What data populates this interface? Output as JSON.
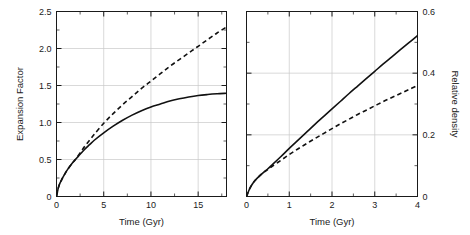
{
  "figure": {
    "width": 470,
    "height": 235,
    "background": "#ffffff",
    "ink_color": "#111111",
    "grid_color": "#c8c8c8"
  },
  "chart_data": [
    {
      "type": "line",
      "panel": "left",
      "title": "",
      "xlabel": "Time (Gyr)",
      "ylabel": "Expansion Factor",
      "xlim": [
        0,
        18
      ],
      "ylim": [
        0,
        2.5
      ],
      "xticks": [
        0,
        5,
        10,
        15
      ],
      "xticklabels": [
        "0",
        "5",
        "10",
        "15"
      ],
      "xminorticks": [
        2.5,
        7.5,
        12.5,
        17.5
      ],
      "yticks": [
        0,
        0.5,
        1.0,
        1.5,
        2.0,
        2.5
      ],
      "yticklabels": [
        "0",
        "0.5",
        "1.0",
        "1.5",
        "2.0",
        "2.5"
      ],
      "yminorticks": [
        0.25,
        0.75,
        1.25,
        1.75,
        2.25
      ],
      "grid": true,
      "yaxis_side": "left",
      "series": [
        {
          "name": "solid-curve",
          "style": "solid",
          "x": [
            0,
            0.2,
            0.4,
            0.6,
            0.9,
            1.2,
            1.6,
            2.0,
            2.5,
            3.0,
            3.5,
            4.0,
            5.0,
            6.0,
            7.0,
            8.0,
            9.0,
            10.0,
            11.0,
            12.0,
            13.0,
            14.0,
            15.0,
            16.0,
            17.0,
            18.0
          ],
          "y": [
            0,
            0.12,
            0.19,
            0.24,
            0.31,
            0.37,
            0.44,
            0.5,
            0.57,
            0.64,
            0.7,
            0.76,
            0.86,
            0.95,
            1.03,
            1.1,
            1.16,
            1.21,
            1.25,
            1.29,
            1.32,
            1.345,
            1.365,
            1.378,
            1.388,
            1.395
          ]
        },
        {
          "name": "dashed-curve",
          "style": "dashed",
          "x": [
            0,
            0.2,
            0.4,
            0.6,
            0.9,
            1.2,
            1.6,
            2.0,
            2.5,
            3.0,
            3.5,
            4.0,
            5.0,
            6.0,
            7.0,
            8.0,
            9.0,
            10.0,
            11.0,
            12.0,
            13.0,
            14.0,
            15.0,
            16.0,
            17.0,
            18.0
          ],
          "y": [
            0,
            0.12,
            0.19,
            0.24,
            0.31,
            0.37,
            0.44,
            0.5,
            0.59,
            0.68,
            0.76,
            0.84,
            0.99,
            1.12,
            1.24,
            1.35,
            1.46,
            1.56,
            1.66,
            1.76,
            1.85,
            1.94,
            2.03,
            2.12,
            2.21,
            2.29
          ]
        }
      ]
    },
    {
      "type": "line",
      "panel": "right",
      "title": "",
      "xlabel": "Time (Gyr)",
      "ylabel": "Relative density",
      "xlim": [
        0,
        4
      ],
      "ylim": [
        0,
        0.6
      ],
      "xticks": [
        0,
        1,
        2,
        3,
        4
      ],
      "xticklabels": [
        "0",
        "1",
        "2",
        "3",
        "4"
      ],
      "xminorticks": [
        0.5,
        1.5,
        2.5,
        3.5
      ],
      "yticks": [
        0,
        0.2,
        0.4,
        0.6
      ],
      "yticklabels": [
        "0",
        "0.2",
        "0.4",
        "0.6"
      ],
      "yminorticks": [
        0.1,
        0.3,
        0.5
      ],
      "grid": true,
      "yaxis_side": "right",
      "series": [
        {
          "name": "solid-curve",
          "style": "solid",
          "x": [
            0,
            0.05,
            0.1,
            0.15,
            0.2,
            0.3,
            0.4,
            0.5,
            0.6,
            0.8,
            1.0,
            1.2,
            1.4,
            1.6,
            1.8,
            2.0,
            2.2,
            2.4,
            2.6,
            2.8,
            3.0,
            3.2,
            3.4,
            3.6,
            3.8,
            4.0
          ],
          "y": [
            0,
            0.018,
            0.032,
            0.043,
            0.052,
            0.066,
            0.078,
            0.09,
            0.103,
            0.129,
            0.156,
            0.182,
            0.208,
            0.234,
            0.259,
            0.284,
            0.309,
            0.334,
            0.358,
            0.382,
            0.406,
            0.43,
            0.453,
            0.476,
            0.499,
            0.522
          ]
        },
        {
          "name": "dashed-curve",
          "style": "dashed",
          "x": [
            0,
            0.05,
            0.1,
            0.15,
            0.2,
            0.3,
            0.4,
            0.5,
            0.6,
            0.8,
            1.0,
            1.2,
            1.4,
            1.6,
            1.8,
            2.0,
            2.2,
            2.4,
            2.6,
            2.8,
            3.0,
            3.2,
            3.4,
            3.6,
            3.8,
            4.0
          ],
          "y": [
            0,
            0.018,
            0.032,
            0.043,
            0.052,
            0.066,
            0.078,
            0.088,
            0.098,
            0.117,
            0.136,
            0.154,
            0.171,
            0.188,
            0.204,
            0.22,
            0.236,
            0.251,
            0.266,
            0.28,
            0.294,
            0.308,
            0.321,
            0.334,
            0.347,
            0.36
          ]
        }
      ]
    }
  ]
}
